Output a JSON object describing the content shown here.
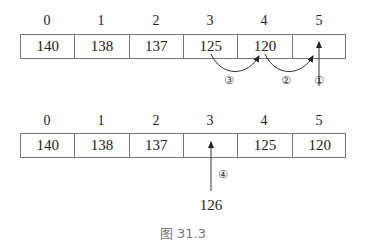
{
  "top_array": {
    "indices": [
      "0",
      "1",
      "2",
      "3",
      "4",
      "5"
    ],
    "values": [
      "140",
      "138",
      "137",
      "125",
      "120",
      ""
    ],
    "steps": [
      {
        "label": "①",
        "description": "arrow pointing up into index 5"
      },
      {
        "label": "②",
        "description": "120 moves from index 4 to index 5"
      },
      {
        "label": "③",
        "description": "125 moves from index 3 to index 4"
      }
    ]
  },
  "bottom_array": {
    "indices": [
      "0",
      "1",
      "2",
      "3",
      "4",
      "5"
    ],
    "values": [
      "140",
      "138",
      "137",
      "",
      "125",
      "120"
    ],
    "step": {
      "label": "④",
      "description": "126 inserted into index 3"
    },
    "inserted_value": "126"
  },
  "caption": "图 31.3",
  "colors": {
    "line": "#777777",
    "text": "#222222",
    "caption": "#777777"
  }
}
